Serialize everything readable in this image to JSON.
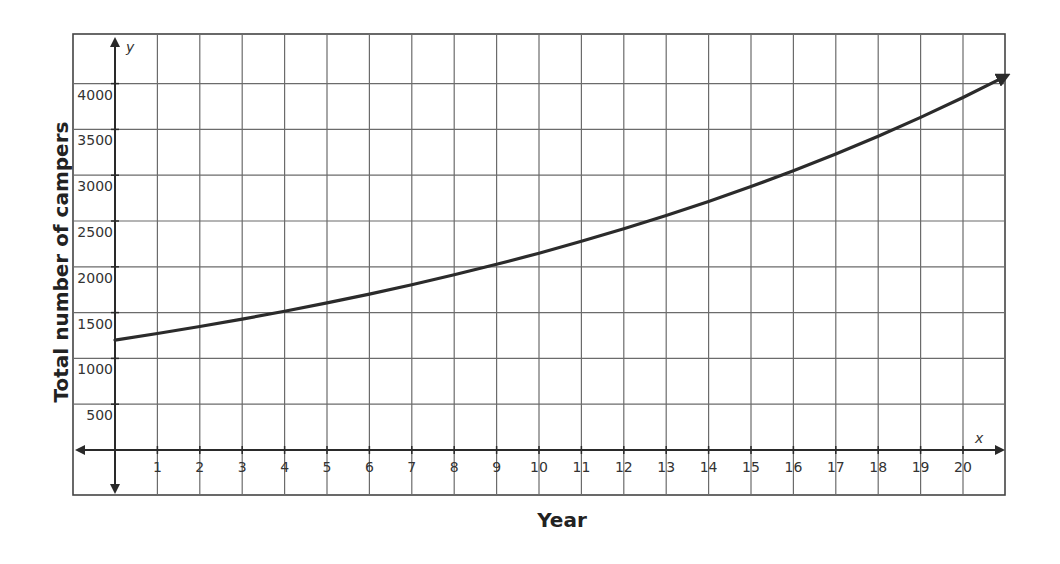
{
  "chart_data": {
    "type": "line",
    "title": "",
    "xlabel": "Year",
    "ylabel": "Total number of campers",
    "x_axis_variable": "x",
    "y_axis_variable": "y",
    "xlim": [
      -1,
      21
    ],
    "ylim": [
      -500,
      4500
    ],
    "x_ticks": [
      1,
      2,
      3,
      4,
      5,
      6,
      7,
      8,
      9,
      10,
      11,
      12,
      13,
      14,
      15,
      16,
      17,
      18,
      19,
      20
    ],
    "y_ticks": [
      500,
      1000,
      1500,
      2000,
      2500,
      3000,
      3500,
      4000
    ],
    "grid": true,
    "legend": null,
    "series": [
      {
        "name": "Total number of campers",
        "x": [
          0,
          1,
          2,
          3,
          4,
          5,
          6,
          7,
          8,
          9,
          10,
          11,
          12,
          13,
          14,
          15,
          16,
          17,
          18,
          19,
          20,
          21
        ],
        "values": [
          1200,
          1272,
          1348,
          1429,
          1515,
          1606,
          1702,
          1804,
          1913,
          2027,
          2149,
          2278,
          2415,
          2560,
          2713,
          2876,
          3049,
          3232,
          3425,
          3631,
          3848,
          4079
        ],
        "arrow_end": true
      }
    ],
    "color": "#2b2b2b"
  }
}
